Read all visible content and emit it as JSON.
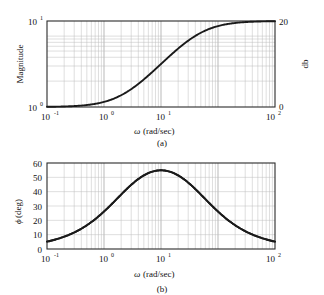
{
  "figure": {
    "panels": [
      {
        "id": "a",
        "caption": "(a)",
        "y_left_label": "Magnitude",
        "y_right_label": "db",
        "x_label_symbol": "ω",
        "x_label_units": " (rad/sec)",
        "x_ticks": [
          "10",
          "10",
          "10",
          "10"
        ],
        "x_tick_exps": [
          "-1",
          "0",
          "1",
          "2"
        ],
        "y_left_ticks": [
          "10",
          "10"
        ],
        "y_left_tick_exps": [
          "1",
          "0"
        ],
        "y_right_ticks": [
          "20",
          "0"
        ]
      },
      {
        "id": "b",
        "caption": "(b)",
        "y_left_label_symbol": "ϕ",
        "y_left_label_units": " (deg)",
        "x_label_symbol": "ω",
        "x_label_units": " (rad/sec)",
        "x_ticks": [
          "10",
          "10",
          "10",
          "10"
        ],
        "x_tick_exps": [
          "-1",
          "0",
          "1",
          "2"
        ],
        "y_ticks": [
          "60",
          "50",
          "40",
          "30",
          "20",
          "10",
          "0"
        ]
      }
    ]
  },
  "colors": {
    "curve": "#1a1a1a",
    "frame": "#2b2b2b",
    "grid_minor": "#bdbdbd",
    "grid_major": "#8a8a8a",
    "background": "#ffffff"
  },
  "chart_data": [
    {
      "type": "line",
      "title": "",
      "subtitle": "",
      "caption": "(a)",
      "xlabel": "ω (rad/sec)",
      "ylabel": "Magnitude",
      "y2label": "db",
      "xscale": "log",
      "yscale": "log",
      "xlim": [
        0.1,
        100
      ],
      "ylim": [
        1,
        10
      ],
      "y2lim": [
        0,
        20
      ],
      "xticks": [
        0.1,
        1,
        10,
        100
      ],
      "xticklabels": [
        "10^-1",
        "10^0",
        "10^1",
        "10^2"
      ],
      "yticks": [
        1,
        10
      ],
      "yticklabels": [
        "10^0",
        "10^1"
      ],
      "y2ticks": [
        0,
        20
      ],
      "y2ticklabels": [
        "0",
        "20"
      ],
      "grid": true,
      "legend": "none",
      "series": [
        {
          "name": "|G(jω)|  lead compensator  (1+jω)/(1+jω/10)",
          "x": [
            0.1,
            0.15,
            0.2,
            0.3,
            0.4,
            0.5,
            0.7,
            1.0,
            1.5,
            2.0,
            3.0,
            4.0,
            5.0,
            7.0,
            10.0,
            15.0,
            20.0,
            30.0,
            50.0,
            70.0,
            100.0
          ],
          "y": [
            1.0,
            1.01,
            1.02,
            1.04,
            1.08,
            1.12,
            1.22,
            1.41,
            1.78,
            2.19,
            3.0,
            3.74,
            4.39,
            5.42,
            6.59,
            7.73,
            8.32,
            8.93,
            9.35,
            9.53,
            9.65
          ],
          "y_db": [
            0.04,
            0.09,
            0.15,
            0.35,
            0.62,
            0.97,
            1.73,
            3.01,
            5.01,
            6.81,
            9.54,
            11.46,
            12.85,
            14.68,
            16.38,
            17.76,
            18.4,
            19.02,
            19.42,
            19.58,
            19.69
          ]
        }
      ]
    },
    {
      "type": "line",
      "title": "",
      "subtitle": "",
      "caption": "(b)",
      "xlabel": "ω (rad/sec)",
      "ylabel": "ϕ (deg)",
      "xscale": "log",
      "yscale": "linear",
      "xlim": [
        0.1,
        100
      ],
      "ylim": [
        0,
        60
      ],
      "xticks": [
        0.1,
        1,
        10,
        100
      ],
      "xticklabels": [
        "10^-1",
        "10^0",
        "10^1",
        "10^2"
      ],
      "yticks": [
        0,
        10,
        20,
        30,
        40,
        50,
        60
      ],
      "yticklabels": [
        "0",
        "10",
        "20",
        "30",
        "40",
        "50",
        "60"
      ],
      "grid": true,
      "legend": "none",
      "annotations": [
        "maximum phase ≈ 55° near ω ≈ 3.2 rad/sec"
      ],
      "series": [
        {
          "name": "∠G(jω)  lead compensator  (1+jω)/(1+jω/10)",
          "x": [
            0.1,
            0.15,
            0.2,
            0.3,
            0.4,
            0.5,
            0.7,
            1.0,
            1.5,
            2.0,
            3.0,
            3.16,
            4.0,
            5.0,
            7.0,
            10.0,
            15.0,
            20.0,
            30.0,
            50.0,
            70.0,
            100.0
          ],
          "y": [
            5.1,
            7.6,
            10.0,
            14.5,
            18.6,
            22.2,
            28.0,
            34.3,
            41.6,
            46.4,
            52.1,
            52.6,
            53.9,
            54.7,
            54.0,
            51.0,
            45.4,
            40.7,
            33.1,
            23.8,
            18.3,
            13.4
          ]
        }
      ]
    }
  ]
}
